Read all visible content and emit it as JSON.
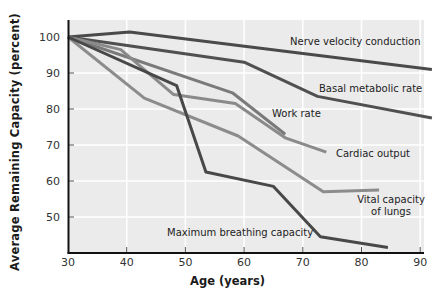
{
  "chart_data": {
    "type": "line",
    "title": "",
    "xlabel": "Age (years)",
    "ylabel": "Average Remaining Capacity (percent)",
    "xlim": [
      30,
      92
    ],
    "ylim": [
      40,
      104
    ],
    "x_ticks": [
      30,
      40,
      50,
      60,
      70,
      80,
      90
    ],
    "y_ticks": [
      50,
      60,
      70,
      80,
      90,
      100
    ],
    "grid": true,
    "legend": "inline labels",
    "series": [
      {
        "name": "Nerve velocity conduction",
        "color": "#4a4a4a",
        "points": [
          [
            30,
            100
          ],
          [
            40.5,
            101.4
          ],
          [
            92,
            91
          ]
        ],
        "label_pos": [
          290,
          45
        ]
      },
      {
        "name": "Basal metabolic rate",
        "color": "#505050",
        "points": [
          [
            30,
            100
          ],
          [
            60,
            93
          ],
          [
            72.5,
            83.5
          ],
          [
            92,
            77.5
          ]
        ],
        "label_pos": [
          319,
          92
        ]
      },
      {
        "name": "Work rate",
        "color": "#7a7a7a",
        "points": [
          [
            30,
            100
          ],
          [
            58,
            84.5
          ],
          [
            67,
            73
          ]
        ],
        "label_pos": [
          272,
          117
        ]
      },
      {
        "name": "Cardiac output",
        "color": "#8a8a8a",
        "points": [
          [
            30,
            100
          ],
          [
            39,
            96.5
          ],
          [
            48,
            84
          ],
          [
            58.5,
            81.5
          ],
          [
            67,
            72
          ],
          [
            74,
            68
          ]
        ],
        "label_pos": [
          336,
          157
        ]
      },
      {
        "name": "Vital capacity of lungs",
        "color": "#8c8c8c",
        "points": [
          [
            30,
            100
          ],
          [
            43,
            83
          ],
          [
            59,
            72.5
          ],
          [
            73.5,
            57
          ],
          [
            83,
            57.5
          ]
        ],
        "label_lines": [
          "Vital capacity",
          "of lungs"
        ],
        "label_pos": [
          353,
          203
        ]
      },
      {
        "name": "Maximum breathing capacity",
        "color": "#484848",
        "points": [
          [
            30,
            100
          ],
          [
            48.5,
            86.5
          ],
          [
            53.5,
            62.5
          ],
          [
            65,
            58.5
          ],
          [
            73,
            44.5
          ],
          [
            84.5,
            41.5
          ]
        ],
        "label_pos": [
          167,
          236
        ]
      }
    ]
  },
  "axes": {
    "x_title": "Age (years)",
    "y_title": "Average Remaining Capacity (percent)"
  }
}
